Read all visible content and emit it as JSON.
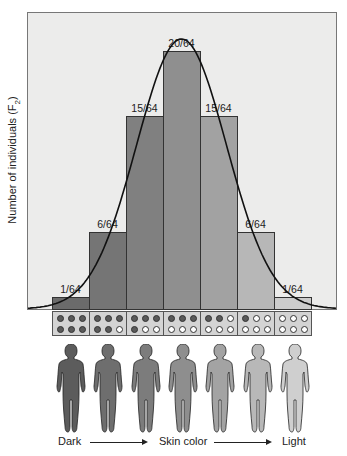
{
  "chart_data": {
    "type": "bar",
    "title": "",
    "xlabel": "Skin color (Dark → Light)",
    "ylabel": "Number of individuals (F2)",
    "categories": [
      "6 dark alleles",
      "5 dark alleles",
      "4 dark alleles",
      "3 dark alleles",
      "2 dark alleles",
      "1 dark allele",
      "0 dark alleles"
    ],
    "values": [
      1,
      6,
      15,
      20,
      15,
      6,
      1
    ],
    "value_labels": [
      "1/64",
      "6/64",
      "15/64",
      "20/64",
      "15/64",
      "6/64",
      "1/64"
    ],
    "denominator": 64,
    "overlay": "normal distribution curve",
    "grid": false,
    "legend": null
  },
  "plot": {
    "ylabel_main": "Number of individuals (F",
    "ylabel_sub": "2",
    "ylabel_end": ")"
  },
  "bars": [
    {
      "label": "1/64",
      "value": 1,
      "color": "#6b6b6b",
      "genotype": [
        "d",
        "d",
        "d",
        "d",
        "d",
        "d"
      ]
    },
    {
      "label": "6/64",
      "value": 6,
      "color": "#757575",
      "genotype": [
        "d",
        "d",
        "d",
        "d",
        "d",
        "l"
      ]
    },
    {
      "label": "15/64",
      "value": 15,
      "color": "#808080",
      "genotype": [
        "d",
        "d",
        "d",
        "d",
        "l",
        "l"
      ]
    },
    {
      "label": "20/64",
      "value": 20,
      "color": "#8f8f8f",
      "genotype": [
        "d",
        "d",
        "d",
        "l",
        "l",
        "l"
      ]
    },
    {
      "label": "15/64",
      "value": 15,
      "color": "#a2a2a2",
      "genotype": [
        "d",
        "d",
        "l",
        "l",
        "l",
        "l"
      ]
    },
    {
      "label": "6/64",
      "value": 6,
      "color": "#b7b7b7",
      "genotype": [
        "d",
        "l",
        "l",
        "l",
        "l",
        "l"
      ]
    },
    {
      "label": "1/64",
      "value": 1,
      "color": "#cccccc",
      "genotype": [
        "l",
        "l",
        "l",
        "l",
        "l",
        "l"
      ]
    }
  ],
  "figures": {
    "colors": [
      "#5c5c5c",
      "#6e6e6e",
      "#7c7c7c",
      "#8e8e8e",
      "#a3a3a3",
      "#b8b8b8",
      "#cfcfcf"
    ]
  },
  "xaxis": {
    "left_label": "Dark",
    "center_label": "Skin color",
    "right_label": "Light"
  }
}
